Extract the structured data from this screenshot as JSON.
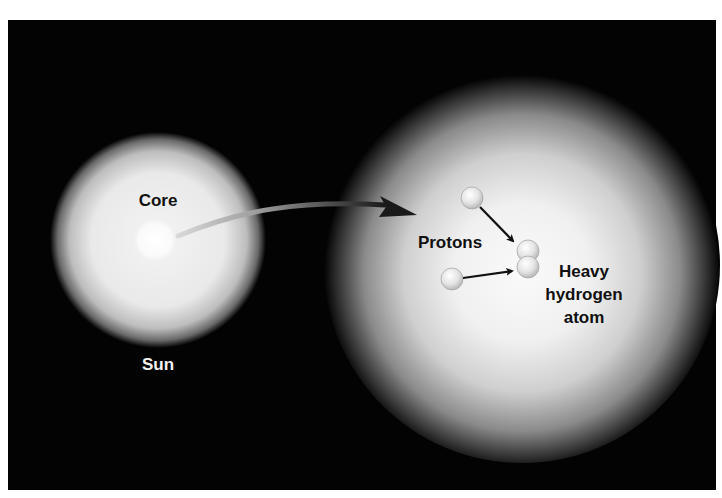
{
  "diagram": {
    "type": "illustration",
    "topic": "Nuclear fusion in the Sun's core",
    "colors": {
      "background": "#030303",
      "page": "#ffffff",
      "glow": "#ffffff",
      "label_dark": "#111111",
      "label_light": "#f2f2f2",
      "arrow": "#1a1a1a",
      "proton_fill": "#e6e6e6"
    },
    "sun": {
      "label": "Sun",
      "core_label": "Core"
    },
    "zoomed_core": {
      "protons_label": "Protons",
      "product_label_line1": "Heavy",
      "product_label_line2": "hydrogen",
      "product_label_line3": "atom"
    },
    "connector": {
      "description": "curved arrow from Sun core to magnified view"
    }
  }
}
